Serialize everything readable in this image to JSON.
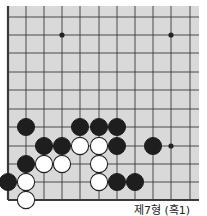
{
  "board": {
    "background": "#d9d9d9",
    "line_color": "#3a3a3a",
    "cols_x": [
      8,
      26,
      44,
      62,
      80,
      99,
      117,
      135,
      153,
      171,
      190
    ],
    "rows_y": [
      17,
      35,
      53,
      72,
      90,
      109,
      127,
      146,
      164,
      182,
      200
    ],
    "area": {
      "left": 8,
      "top": 6,
      "right": 199,
      "bottom": 200
    },
    "edges": [
      "left",
      "bottom"
    ],
    "star_points": [
      [
        3,
        1
      ],
      [
        9,
        1
      ],
      [
        9,
        7
      ]
    ],
    "stone_radius": 8.6,
    "black_stones": [
      [
        1,
        6
      ],
      [
        4,
        6
      ],
      [
        5,
        6
      ],
      [
        6,
        6
      ],
      [
        2,
        7
      ],
      [
        3,
        7
      ],
      [
        6,
        7
      ],
      [
        8,
        7
      ],
      [
        1,
        8
      ],
      [
        0,
        9
      ],
      [
        6,
        9
      ],
      [
        7,
        9
      ]
    ],
    "white_stones": [
      [
        4,
        7
      ],
      [
        5,
        7
      ],
      [
        2,
        8
      ],
      [
        3,
        8
      ],
      [
        5,
        8
      ],
      [
        1,
        9
      ],
      [
        5,
        9
      ],
      [
        1,
        10
      ]
    ]
  },
  "caption": "제7형 (흑1)"
}
